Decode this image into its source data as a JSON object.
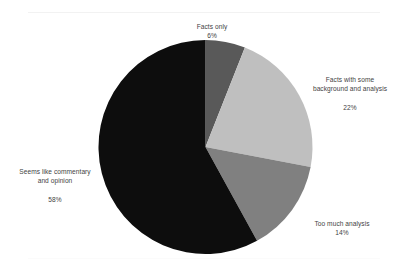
{
  "chart_data": {
    "type": "pie",
    "title": "",
    "labels": [
      "Facts only",
      "Facts with some background and analysis",
      "Too much analysis",
      "Seems like commentary and opinion"
    ],
    "values": [
      6,
      22,
      14,
      58
    ],
    "value_labels": [
      "6%",
      "22%",
      "14%",
      "58%"
    ],
    "colors": [
      "#595959",
      "#bfbfbf",
      "#808080",
      "#0d0d0d"
    ],
    "start_angle_deg": 0,
    "direction": "clockwise",
    "legend": "none",
    "labels_position": "outside",
    "grid": false,
    "background": "#ffffff"
  },
  "slices": [
    {
      "name": "facts-only",
      "label_line1": "Facts only",
      "label_line2": "",
      "percent": "6%",
      "color": "#595959"
    },
    {
      "name": "facts-with-background",
      "label_line1": "Facts with some",
      "label_line2": "background and analysis",
      "percent": "22%",
      "color": "#bfbfbf"
    },
    {
      "name": "too-much-analysis",
      "label_line1": "Too much analysis",
      "label_line2": "",
      "percent": "14%",
      "color": "#808080"
    },
    {
      "name": "commentary-and-opinion",
      "label_line1": "Seems like commentary",
      "label_line2": "and opinion",
      "percent": "58%",
      "color": "#0d0d0d"
    }
  ]
}
